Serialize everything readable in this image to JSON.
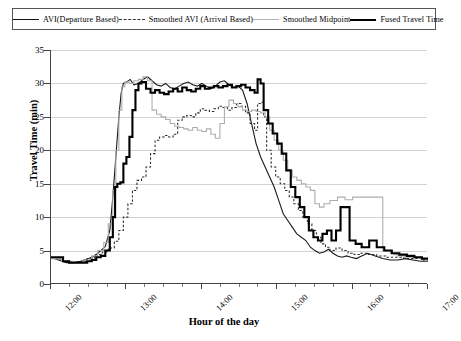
{
  "legend": {
    "items": [
      {
        "label": "AVI(Departure Based)",
        "key": "solid-line",
        "color": "#1a1a1a"
      },
      {
        "label": "Smoothed AVI (Arrival Based)",
        "key": "dashed-line",
        "color": "#2b2b2b"
      },
      {
        "label": "Smoothed Midpoint",
        "key": "light-solid-line",
        "color": "#adadad"
      },
      {
        "label": "Fused Travel Time",
        "key": "bold-solid-line",
        "color": "#000000"
      }
    ]
  },
  "chart_data": {
    "type": "line",
    "title": "",
    "xlabel": "Hour of the day",
    "ylabel": "Travel Time (min)",
    "xlim": [
      12,
      17
    ],
    "ylim": [
      0,
      35
    ],
    "yticks": [
      0,
      5,
      10,
      15,
      20,
      25,
      30,
      35
    ],
    "xticks": [
      "12:00",
      "13:00",
      "14:00",
      "15:00",
      "16:00",
      "17:00"
    ],
    "xtick_values": [
      12,
      13,
      14,
      15,
      16,
      17
    ],
    "minor_xtick_interval_hours": 0.25,
    "grid": "horizontal",
    "legend_position": "top",
    "series": [
      {
        "name": "AVI(Departure Based)",
        "style": "solid",
        "color": "#1a1a1a",
        "x": [
          12.0,
          12.1,
          12.2,
          12.3,
          12.4,
          12.5,
          12.58,
          12.66,
          12.72,
          12.78,
          12.82,
          12.86,
          12.9,
          12.93,
          12.96,
          13.0,
          13.05,
          13.1,
          13.16,
          13.22,
          13.28,
          13.34,
          13.4,
          13.46,
          13.52,
          13.58,
          13.64,
          13.7,
          13.76,
          13.82,
          13.88,
          13.94,
          14.0,
          14.06,
          14.12,
          14.18,
          14.24,
          14.3,
          14.36,
          14.42,
          14.48,
          14.54,
          14.6,
          14.66,
          14.72,
          14.78,
          14.84,
          14.9,
          14.96,
          15.02,
          15.08,
          15.14,
          15.2,
          15.26,
          15.32,
          15.38,
          15.44,
          15.5,
          15.56,
          15.62,
          15.68,
          15.74,
          15.8,
          15.86,
          15.92,
          15.98,
          16.05,
          16.12,
          16.2,
          16.3,
          16.4,
          16.5,
          16.6,
          16.7,
          16.8,
          16.9,
          17.0
        ],
        "y": [
          4.0,
          3.6,
          3.2,
          3.2,
          3.4,
          3.8,
          4.2,
          5.0,
          5.6,
          8.0,
          13.0,
          19.0,
          25.0,
          28.5,
          30.0,
          30.2,
          30.6,
          29.8,
          30.0,
          30.6,
          31.0,
          30.4,
          29.8,
          29.6,
          30.0,
          29.4,
          29.2,
          29.6,
          30.0,
          30.2,
          29.8,
          29.6,
          30.0,
          29.6,
          29.2,
          29.6,
          30.2,
          30.4,
          29.8,
          29.4,
          29.6,
          29.0,
          27.0,
          24.0,
          21.0,
          19.0,
          17.5,
          16.0,
          14.5,
          12.5,
          10.5,
          9.5,
          8.5,
          7.5,
          7.0,
          6.5,
          5.5,
          5.0,
          4.6,
          4.8,
          5.2,
          4.6,
          4.2,
          4.0,
          4.2,
          4.0,
          3.8,
          4.2,
          4.6,
          4.2,
          3.8,
          3.6,
          3.6,
          3.8,
          3.6,
          3.4,
          3.4
        ]
      },
      {
        "name": "Smoothed AVI (Arrival Based)",
        "style": "dashed",
        "color": "#2b2b2b",
        "x": [
          12.0,
          12.12,
          12.24,
          12.36,
          12.48,
          12.58,
          12.68,
          12.76,
          12.84,
          12.9,
          12.96,
          13.02,
          13.08,
          13.14,
          13.2,
          13.26,
          13.32,
          13.38,
          13.44,
          13.5,
          13.56,
          13.62,
          13.68,
          13.74,
          13.8,
          13.86,
          13.92,
          13.98,
          14.04,
          14.1,
          14.16,
          14.22,
          14.28,
          14.34,
          14.4,
          14.46,
          14.52,
          14.58,
          14.64,
          14.7,
          14.74,
          14.78,
          14.82,
          14.86,
          14.92,
          14.98,
          15.04,
          15.1,
          15.16,
          15.22,
          15.28,
          15.34,
          15.4,
          15.46,
          15.52,
          15.58,
          15.64,
          15.7,
          15.78,
          15.86,
          15.94,
          16.02,
          16.1,
          16.2,
          16.32,
          16.44,
          16.56,
          16.68,
          16.8,
          16.92,
          17.0
        ],
        "y": [
          3.8,
          3.4,
          3.2,
          3.4,
          3.8,
          4.4,
          4.8,
          5.4,
          6.4,
          8.0,
          10.0,
          12.0,
          14.0,
          15.5,
          16.0,
          17.5,
          19.5,
          21.5,
          22.0,
          22.2,
          22.0,
          22.4,
          24.5,
          25.0,
          25.2,
          25.0,
          25.6,
          26.2,
          26.0,
          25.8,
          26.2,
          26.6,
          26.4,
          26.0,
          26.4,
          27.0,
          26.6,
          25.6,
          24.0,
          23.0,
          27.0,
          27.2,
          25.0,
          20.0,
          17.5,
          16.0,
          15.0,
          14.0,
          13.0,
          12.0,
          11.0,
          10.0,
          9.0,
          8.0,
          7.0,
          6.0,
          5.5,
          5.0,
          5.4,
          5.0,
          4.6,
          4.4,
          4.6,
          4.4,
          4.2,
          4.0,
          4.0,
          3.8,
          3.8,
          3.6,
          3.6
        ]
      },
      {
        "name": "Smoothed Midpoint",
        "style": "light-solid",
        "color": "#adadad",
        "x": [
          12.0,
          12.14,
          12.28,
          12.42,
          12.54,
          12.62,
          12.7,
          12.76,
          12.82,
          12.86,
          12.9,
          12.94,
          12.98,
          13.04,
          13.1,
          13.16,
          13.22,
          13.28,
          13.34,
          13.4,
          13.46,
          13.52,
          13.58,
          13.64,
          13.7,
          13.76,
          13.82,
          13.88,
          13.94,
          14.0,
          14.06,
          14.12,
          14.18,
          14.24,
          14.3,
          14.36,
          14.42,
          14.48,
          14.54,
          14.6,
          14.66,
          14.72,
          14.78,
          14.84,
          14.9,
          14.96,
          15.02,
          15.08,
          15.14,
          15.2,
          15.26,
          15.32,
          15.38,
          15.44,
          15.5,
          15.56,
          15.62,
          15.7,
          15.8,
          15.9,
          16.0,
          16.1,
          16.2,
          16.3,
          16.4,
          16.5,
          16.55,
          16.6,
          16.7,
          16.8,
          16.9,
          17.0
        ],
        "y": [
          3.8,
          3.4,
          3.2,
          3.6,
          4.2,
          5.0,
          6.2,
          9.0,
          14.0,
          20.0,
          26.0,
          29.5,
          30.2,
          30.0,
          30.4,
          30.6,
          31.0,
          30.4,
          26.0,
          25.4,
          25.0,
          24.6,
          24.0,
          23.6,
          23.4,
          23.2,
          23.0,
          23.4,
          23.0,
          22.8,
          23.2,
          22.4,
          21.8,
          24.0,
          26.5,
          27.5,
          27.0,
          26.5,
          26.0,
          25.8,
          26.0,
          25.8,
          25.6,
          25.0,
          23.0,
          21.5,
          20.0,
          18.5,
          17.0,
          16.0,
          15.5,
          15.0,
          14.5,
          14.0,
          12.0,
          11.5,
          12.0,
          12.5,
          13.0,
          12.6,
          13.0,
          13.0,
          13.0,
          13.0,
          5.0,
          4.6,
          4.4,
          4.2,
          4.0,
          4.0,
          3.8,
          3.8
        ]
      },
      {
        "name": "Fused Travel Time",
        "style": "bold-solid",
        "color": "#000000",
        "x": [
          12.0,
          12.08,
          12.16,
          12.24,
          12.32,
          12.4,
          12.48,
          12.54,
          12.6,
          12.66,
          12.72,
          12.78,
          12.82,
          12.85,
          12.88,
          12.92,
          12.96,
          13.0,
          13.04,
          13.08,
          13.12,
          13.16,
          13.2,
          13.26,
          13.32,
          13.38,
          13.44,
          13.5,
          13.56,
          13.62,
          13.68,
          13.74,
          13.8,
          13.86,
          13.92,
          13.98,
          14.04,
          14.1,
          14.16,
          14.22,
          14.28,
          14.34,
          14.4,
          14.46,
          14.52,
          14.58,
          14.64,
          14.7,
          14.74,
          14.78,
          14.82,
          14.88,
          14.94,
          15.0,
          15.06,
          15.12,
          15.18,
          15.24,
          15.3,
          15.36,
          15.42,
          15.48,
          15.54,
          15.6,
          15.66,
          15.72,
          15.78,
          15.84,
          15.9,
          15.96,
          16.04,
          16.12,
          16.22,
          16.32,
          16.42,
          16.52,
          16.62,
          16.72,
          16.82,
          16.92,
          17.0
        ],
        "y": [
          4.0,
          4.0,
          3.4,
          3.2,
          3.2,
          3.2,
          3.4,
          3.6,
          4.0,
          4.2,
          5.0,
          7.0,
          10.0,
          14.5,
          15.0,
          15.2,
          18.0,
          19.0,
          22.0,
          26.0,
          29.0,
          30.0,
          30.2,
          29.2,
          28.6,
          29.0,
          28.6,
          28.4,
          28.8,
          29.2,
          28.8,
          29.4,
          29.0,
          28.8,
          29.2,
          29.6,
          29.2,
          29.4,
          29.6,
          29.4,
          29.6,
          29.8,
          29.4,
          29.6,
          29.8,
          29.4,
          29.0,
          28.6,
          30.6,
          30.0,
          26.0,
          24.0,
          22.5,
          21.0,
          19.5,
          17.0,
          14.5,
          13.0,
          11.5,
          10.0,
          8.0,
          7.0,
          6.5,
          7.5,
          8.0,
          6.5,
          8.0,
          11.5,
          11.5,
          6.5,
          6.0,
          5.5,
          6.5,
          5.5,
          5.0,
          4.6,
          4.4,
          4.2,
          4.0,
          3.8,
          3.8
        ]
      }
    ]
  }
}
